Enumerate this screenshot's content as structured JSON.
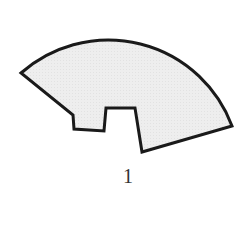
{
  "figure": {
    "label": "1",
    "shape": "sector-with-notch",
    "fill_color": "#ececec",
    "stroke_color": "#1a1a1a",
    "stroke_width": 3
  }
}
